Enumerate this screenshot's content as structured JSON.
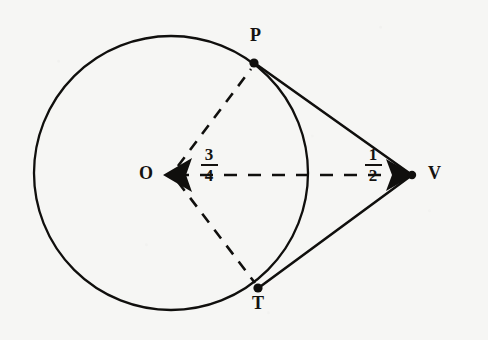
{
  "figure": {
    "type": "geometry-diagram",
    "background_color": "#f6f6f4",
    "ink_color": "#100f0d"
  },
  "geometry": {
    "circle": {
      "label": "circle-O",
      "center_x": 171,
      "center_y": 173,
      "radius": 137
    },
    "points": [
      {
        "name": "O",
        "label": "O",
        "x": 171,
        "y": 173,
        "label_dx": -22,
        "label_dy": -9,
        "marker": "arrow-left"
      },
      {
        "name": "P",
        "label": "P",
        "x": 254,
        "y": 63,
        "label_dx": -2,
        "label_dy": -28,
        "marker": "dot"
      },
      {
        "name": "T",
        "label": "T",
        "x": 258,
        "y": 288,
        "label_dx": -4,
        "label_dy": 8,
        "marker": "dot"
      },
      {
        "name": "V",
        "label": "V",
        "x": 412,
        "y": 175,
        "label_dx": 14,
        "label_dy": -10,
        "marker": "arrow-right"
      }
    ],
    "segments": [
      {
        "name": "radius-OP",
        "from": "O",
        "to": "P",
        "style": "dashed"
      },
      {
        "name": "radius-OT",
        "from": "O",
        "to": "T",
        "style": "dashed"
      },
      {
        "name": "line-OV",
        "from": "O",
        "to": "V",
        "style": "dashed",
        "arrows": "both"
      },
      {
        "name": "tangent-PV",
        "from": "P",
        "to": "V",
        "style": "solid"
      },
      {
        "name": "tangent-TV",
        "from": "T",
        "to": "V",
        "style": "solid"
      }
    ]
  },
  "annotations": [
    {
      "name": "measure-radius",
      "numerator": "3",
      "denominator": "4",
      "x": 204,
      "y": 148,
      "refers_to": "radius-OP"
    },
    {
      "name": "measure-vertex",
      "numerator": "1",
      "denominator": "2",
      "x": 365,
      "y": 148,
      "refers_to": "segment-at-V"
    }
  ]
}
